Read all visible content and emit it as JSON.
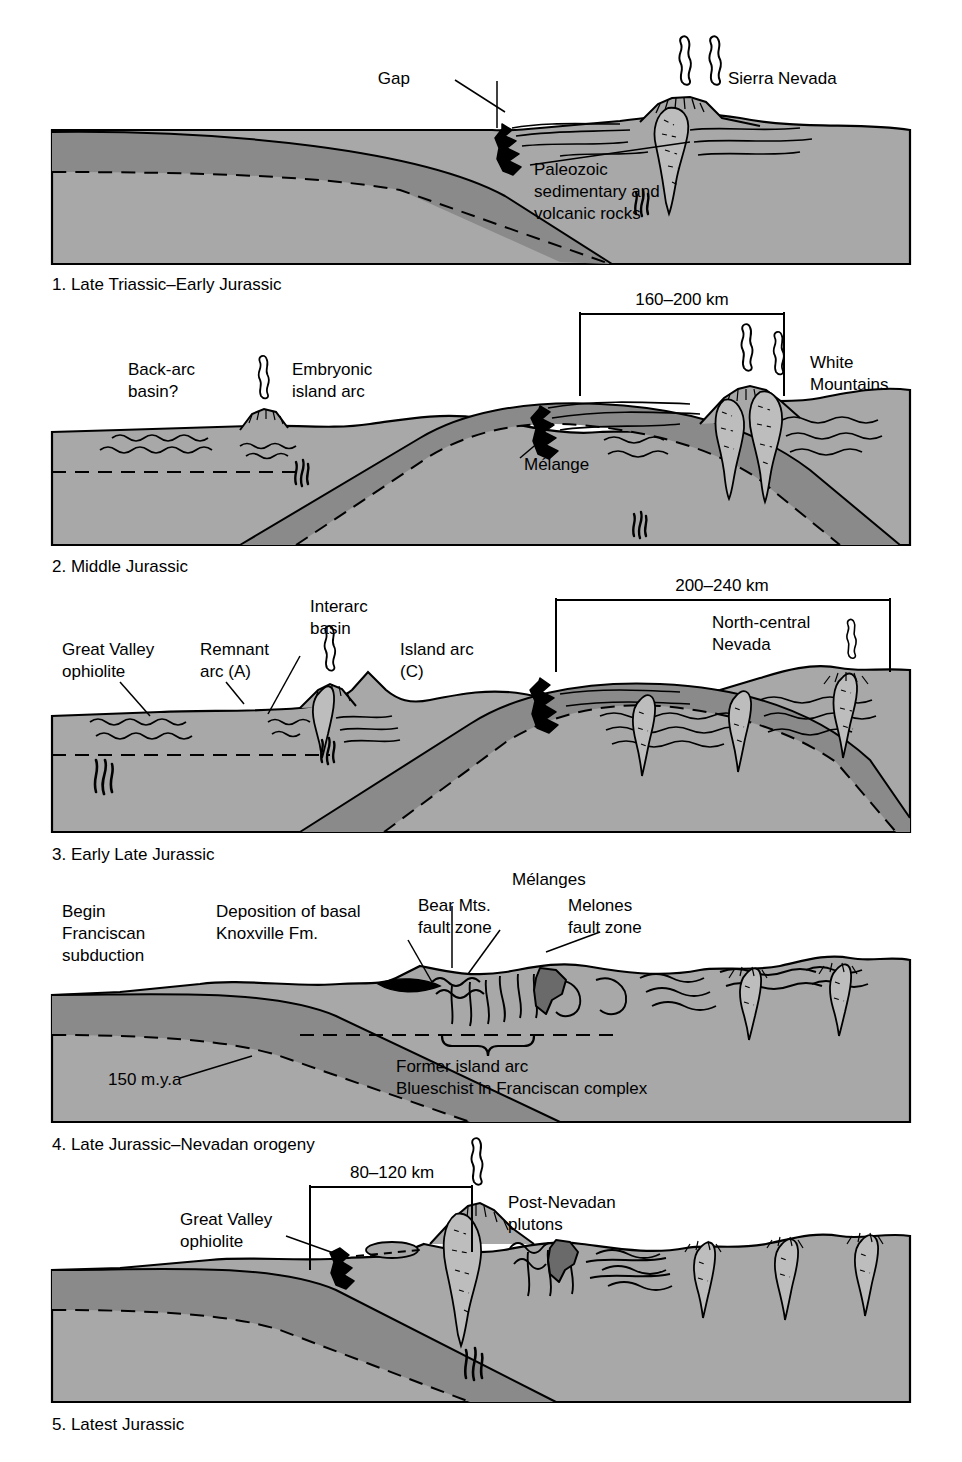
{
  "figure": {
    "colors": {
      "background": "#ffffff",
      "upper_plate_crust": "#8a8a8a",
      "lower_mantle": "#a8a8a8",
      "slab": "#8a8a8a",
      "melange_black": "#000000",
      "pluton_fill": "#b5b5b5",
      "outline": "#000000"
    },
    "panels": [
      {
        "id": 1,
        "caption": "1. Late Triassic–Early Jurassic",
        "labels": [
          {
            "name": "gap",
            "text": "Gap"
          },
          {
            "name": "sierra-nevada",
            "text": "Sierra Nevada"
          },
          {
            "name": "paleozoic-rocks",
            "text": "Paleozoic\nsedimentary and\nvolcanic rocks"
          }
        ],
        "scale_bar": null
      },
      {
        "id": 2,
        "caption": "2. Middle Jurassic",
        "labels": [
          {
            "name": "back-arc-basin",
            "text": "Back-arc\nbasin?"
          },
          {
            "name": "embryonic-island-arc",
            "text": "Embryonic\nisland arc"
          },
          {
            "name": "melange",
            "text": "Mélange"
          },
          {
            "name": "white-mountains",
            "text": "White\nMountains"
          }
        ],
        "scale_bar": {
          "text": "160–200 km"
        }
      },
      {
        "id": 3,
        "caption": "3. Early Late Jurassic",
        "labels": [
          {
            "name": "great-valley-ophiolite",
            "text": "Great Valley\nophiolite"
          },
          {
            "name": "remnant-arc",
            "text": "Remnant\narc (A)"
          },
          {
            "name": "interarc-basin",
            "text": "Interarc\nbasin"
          },
          {
            "name": "island-arc",
            "text": "Island arc\n(C)"
          },
          {
            "name": "north-central-nevada",
            "text": "North-central\nNevada"
          }
        ],
        "scale_bar": {
          "text": "200–240 km"
        }
      },
      {
        "id": 4,
        "caption": "4. Late Jurassic–Nevadan orogeny",
        "labels": [
          {
            "name": "begin-franciscan-subduction",
            "text": "Begin\nFranciscan\nsubduction"
          },
          {
            "name": "deposition-knoxville",
            "text": "Deposition of basal\nKnoxville Fm."
          },
          {
            "name": "bear-mts-fault-zone",
            "text": "Bear Mts.\nfault zone"
          },
          {
            "name": "melanges",
            "text": "Mélanges"
          },
          {
            "name": "melones-fault-zone",
            "text": "Melones\nfault zone"
          },
          {
            "name": "age-150-mya",
            "text": "150 m.y.a"
          },
          {
            "name": "former-island-arc",
            "text": "Former island arc"
          },
          {
            "name": "blueschist-franciscan",
            "text": "Blueschist in Franciscan complex"
          }
        ],
        "scale_bar": null
      },
      {
        "id": 5,
        "caption": "5. Latest Jurassic",
        "labels": [
          {
            "name": "great-valley-ophiolite",
            "text": "Great Valley\nophiolite"
          },
          {
            "name": "post-nevadan-plutons",
            "text": "Post-Nevadan\nplutons"
          }
        ],
        "scale_bar": {
          "text": "80–120 km"
        }
      }
    ],
    "text": {
      "p1_gap": "Gap",
      "p1_sierra": "Sierra Nevada",
      "p1_paleo_1": "Paleozoic",
      "p1_paleo_2": "sedimentary and",
      "p1_paleo_3": "volcanic rocks",
      "p1_caption": "1. Late Triassic–Early Jurassic",
      "p2_scale": "160–200 km",
      "p2_backarc_1": "Back-arc",
      "p2_backarc_2": "basin?",
      "p2_embryonic_1": "Embryonic",
      "p2_embryonic_2": "island arc",
      "p2_melange": "Mélange",
      "p2_white_1": "White",
      "p2_white_2": "Mountains",
      "p2_caption": "2. Middle Jurassic",
      "p3_scale": "200–240 km",
      "p3_gvo_1": "Great Valley",
      "p3_gvo_2": "ophiolite",
      "p3_remnant_1": "Remnant",
      "p3_remnant_2": "arc (A)",
      "p3_interarc_1": "Interarc",
      "p3_interarc_2": "basin",
      "p3_island_1": "Island arc",
      "p3_island_2": "(C)",
      "p3_ncn_1": "North-central",
      "p3_ncn_2": "Nevada",
      "p3_caption": "3. Early Late Jurassic",
      "p4_begin_1": "Begin",
      "p4_begin_2": "Franciscan",
      "p4_begin_3": "subduction",
      "p4_knox_1": "Deposition of basal",
      "p4_knox_2": "Knoxville Fm.",
      "p4_bear_1": "Bear Mts.",
      "p4_bear_2": "fault zone",
      "p4_melanges": "Mélanges",
      "p4_melones_1": "Melones",
      "p4_melones_2": "fault zone",
      "p4_age": "150 m.y.a",
      "p4_former": "Former island arc",
      "p4_blue": "Blueschist in Franciscan complex",
      "p4_caption": "4. Late Jurassic–Nevadan orogeny",
      "p5_scale": "80–120 km",
      "p5_gvo_1": "Great Valley",
      "p5_gvo_2": "ophiolite",
      "p5_plutons_1": "Post-Nevadan",
      "p5_plutons_2": "plutons",
      "p5_caption": "5. Latest Jurassic"
    }
  }
}
